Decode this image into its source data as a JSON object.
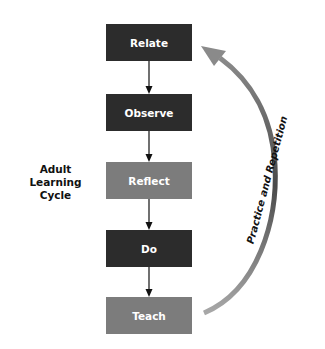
{
  "diagram": {
    "title_lines": [
      "Adult",
      "Learning",
      "Cycle"
    ],
    "steps": [
      {
        "label": "Relate",
        "color": "#2c2c2c"
      },
      {
        "label": "Observe",
        "color": "#2c2c2c"
      },
      {
        "label": "Reflect",
        "color": "#7c7c7c"
      },
      {
        "label": "Do",
        "color": "#2c2c2c"
      },
      {
        "label": "Teach",
        "color": "#7c7c7c"
      }
    ],
    "return_arrow_label": "Practice and Repetition"
  }
}
